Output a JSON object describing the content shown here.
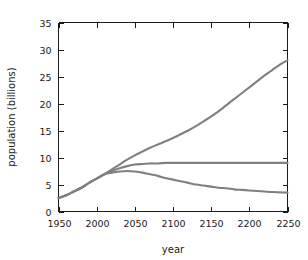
{
  "chart_data": {
    "type": "line",
    "title": "",
    "xlabel": "year",
    "ylabel": "population (billions)",
    "xlim": [
      1950,
      2250
    ],
    "ylim": [
      0,
      35
    ],
    "xticks": [
      1950,
      2000,
      2050,
      2100,
      2150,
      2200,
      2250
    ],
    "yticks": [
      0,
      5,
      10,
      15,
      20,
      25,
      30,
      35
    ],
    "xtick_labels": [
      "1950",
      "2000",
      "2050",
      "2100",
      "2150",
      "2200",
      "2250"
    ],
    "ytick_labels": [
      "0",
      "5",
      "10",
      "15",
      "20",
      "25",
      "30",
      "35"
    ],
    "grid": false,
    "legend": "none",
    "line_color": "#808080",
    "axis_color": "#1a1a1a",
    "background": "#ffffff",
    "x": [
      1950,
      1960,
      1970,
      1980,
      1990,
      2000,
      2010,
      2020,
      2030,
      2040,
      2050,
      2060,
      2070,
      2080,
      2090,
      2100,
      2110,
      2120,
      2130,
      2140,
      2150,
      2160,
      2170,
      2180,
      2190,
      2200,
      2210,
      2220,
      2230,
      2240,
      2250
    ],
    "series": [
      {
        "name": "high projection",
        "values": [
          2.5,
          3.0,
          3.7,
          4.4,
          5.3,
          6.1,
          6.9,
          7.8,
          8.7,
          9.6,
          10.4,
          11.1,
          11.8,
          12.4,
          13.0,
          13.6,
          14.3,
          15.0,
          15.8,
          16.7,
          17.6,
          18.6,
          19.7,
          20.8,
          21.9,
          23.0,
          24.1,
          25.2,
          26.2,
          27.2,
          28.0
        ]
      },
      {
        "name": "medium projection",
        "values": [
          2.5,
          3.0,
          3.7,
          4.4,
          5.3,
          6.1,
          6.9,
          7.5,
          8.0,
          8.4,
          8.7,
          8.8,
          8.9,
          8.9,
          9.0,
          9.0,
          9.0,
          9.0,
          9.0,
          9.0,
          9.0,
          9.0,
          9.0,
          9.0,
          9.0,
          9.0,
          9.0,
          9.0,
          9.0,
          9.0,
          9.0
        ]
      },
      {
        "name": "low projection",
        "values": [
          2.5,
          3.0,
          3.7,
          4.4,
          5.3,
          6.1,
          6.9,
          7.2,
          7.4,
          7.5,
          7.4,
          7.2,
          6.9,
          6.6,
          6.2,
          5.9,
          5.6,
          5.3,
          5.0,
          4.8,
          4.6,
          4.4,
          4.3,
          4.1,
          4.0,
          3.9,
          3.8,
          3.7,
          3.6,
          3.55,
          3.5
        ]
      }
    ]
  }
}
